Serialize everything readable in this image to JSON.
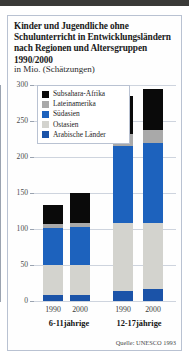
{
  "figure": {
    "title": "Kinder und Jugendliche ohne Schulunterricht in Entwicklungsländern nach Regionen und Altersgruppen 1990/2000",
    "subtitle": "in Mio. (Schätzungen)",
    "source": "Quelle: UNESCO 1993"
  },
  "chart_data": {
    "type": "bar",
    "title": "Kinder und Jugendliche ohne Schulunterricht in Entwicklungsländern nach Regionen und Altersgruppen 1990/2000",
    "subtitle": "in Mio. (Schätzungen)",
    "stacked": true,
    "xlabel": "",
    "ylabel": "in Mio.",
    "ylim": [
      0,
      300
    ],
    "yticks": [
      0,
      50,
      100,
      150,
      200,
      250,
      300
    ],
    "grid": true,
    "legend_position": "upper-left-inside",
    "groups": [
      {
        "label": "6-11jährige",
        "categories": [
          "1990",
          "2000"
        ]
      },
      {
        "label": "12-17jährige",
        "categories": [
          "1990",
          "2000"
        ]
      }
    ],
    "categories": [
      "1990",
      "2000",
      "1990",
      "2000"
    ],
    "series": [
      {
        "name": "Arabische Länder",
        "color": "#1b53a8",
        "values": [
          8,
          8,
          14,
          16
        ]
      },
      {
        "name": "Ostasien",
        "color": "#d3d3ce",
        "values": [
          42,
          42,
          95,
          92
        ]
      },
      {
        "name": "Südasien",
        "color": "#1d62bd",
        "values": [
          52,
          53,
          106,
          112
        ]
      },
      {
        "name": "Lateinamerika",
        "color": "#a9a9a9",
        "values": [
          5,
          5,
          17,
          18
        ]
      },
      {
        "name": "Subsahara-Afrika",
        "color": "#0a0a0a",
        "values": [
          26,
          42,
          53,
          57
        ]
      }
    ],
    "totals": [
      133,
      150,
      285,
      295
    ],
    "annotations": [
      "Quelle: UNESCO 1993"
    ]
  },
  "legend": {
    "items": [
      {
        "label": "Subsahara-Afrika",
        "color": "#0a0a0a"
      },
      {
        "label": "Lateinamerika",
        "color": "#a9a9a9"
      },
      {
        "label": "Südasien",
        "color": "#1d62bd"
      },
      {
        "label": "Ostasien",
        "color": "#d3d3ce"
      },
      {
        "label": "Arabische Länder",
        "color": "#1b53a8"
      }
    ]
  },
  "axis": {
    "yticks": [
      "300",
      "250",
      "200",
      "150",
      "100",
      "50",
      "0"
    ],
    "xticks": [
      "1990",
      "2000",
      "1990",
      "2000"
    ],
    "grouplabels": [
      "6-11jährige",
      "12-17jährige"
    ]
  }
}
